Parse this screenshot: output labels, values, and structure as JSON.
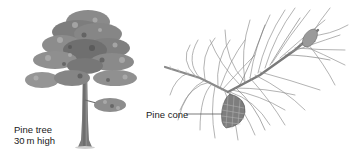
{
  "figure": {
    "tree": {
      "label_line1": "Pine tree",
      "label_line2": "30 m high"
    },
    "branch": {
      "cone_label": "Pine cone"
    }
  },
  "colors": {
    "foliage_dark": "#5a5a5a",
    "foliage_mid": "#8a8a8a",
    "foliage_light": "#b5b5b5",
    "trunk": "#6e6e6e",
    "needles": "#8c8c8c",
    "cone": "#777777",
    "text": "#1a1a1a"
  }
}
